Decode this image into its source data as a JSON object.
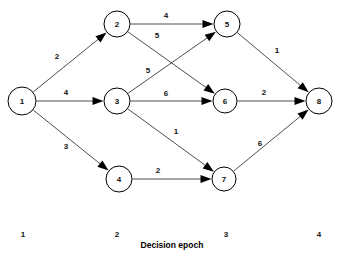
{
  "figure": {
    "type": "directed-network-diagram",
    "width": 338,
    "height": 258,
    "background_color": "#ffffff",
    "line_color": "#3a3a3a",
    "node_fill": "#ffffff",
    "node_stroke": "#000000",
    "text_color": "#111111"
  },
  "axis": {
    "caption": "Decision epoch",
    "caption_x": 172,
    "caption_y": 245,
    "ticks": [
      {
        "label": "1",
        "x": 23,
        "y": 234
      },
      {
        "label": "2",
        "x": 117,
        "y": 234
      },
      {
        "label": "3",
        "x": 226,
        "y": 234
      },
      {
        "label": "4",
        "x": 319,
        "y": 234
      }
    ]
  },
  "nodes": [
    {
      "id": "1",
      "label": "1",
      "x": 22,
      "y": 101,
      "r": 14,
      "stage": 1
    },
    {
      "id": "2",
      "label": "2",
      "x": 117,
      "y": 24,
      "r": 13,
      "stage": 2
    },
    {
      "id": "3",
      "label": "3",
      "x": 117,
      "y": 101,
      "r": 13,
      "stage": 2
    },
    {
      "id": "4",
      "label": "4",
      "x": 119,
      "y": 179,
      "r": 13,
      "stage": 2
    },
    {
      "id": "5",
      "label": "5",
      "x": 227,
      "y": 24,
      "r": 13,
      "stage": 3
    },
    {
      "id": "6",
      "label": "6",
      "x": 225,
      "y": 101,
      "r": 12,
      "stage": 3
    },
    {
      "id": "7",
      "label": "7",
      "x": 224,
      "y": 179,
      "r": 12,
      "stage": 3
    },
    {
      "id": "8",
      "label": "8",
      "x": 319,
      "y": 101,
      "r": 13,
      "stage": 4
    }
  ],
  "edges": [
    {
      "from": "1",
      "to": "2",
      "weight": "2",
      "label_x": 57,
      "label_y": 56
    },
    {
      "from": "1",
      "to": "3",
      "weight": "4",
      "label_x": 66,
      "label_y": 92
    },
    {
      "from": "1",
      "to": "4",
      "weight": "3",
      "label_x": 66,
      "label_y": 146
    },
    {
      "from": "2",
      "to": "5",
      "weight": "4",
      "label_x": 166,
      "label_y": 15
    },
    {
      "from": "2",
      "to": "6",
      "weight": "5",
      "label_x": 157,
      "label_y": 35
    },
    {
      "from": "3",
      "to": "5",
      "weight": "5",
      "label_x": 148,
      "label_y": 70
    },
    {
      "from": "3",
      "to": "6",
      "weight": "6",
      "label_x": 166,
      "label_y": 93
    },
    {
      "from": "3",
      "to": "7",
      "weight": "1",
      "label_x": 176,
      "label_y": 131
    },
    {
      "from": "4",
      "to": "7",
      "weight": "2",
      "label_x": 158,
      "label_y": 170
    },
    {
      "from": "5",
      "to": "8",
      "weight": "1",
      "label_x": 277,
      "label_y": 50
    },
    {
      "from": "6",
      "to": "8",
      "weight": "2",
      "label_x": 264,
      "label_y": 92
    },
    {
      "from": "7",
      "to": "8",
      "weight": "6",
      "label_x": 260,
      "label_y": 143
    }
  ]
}
